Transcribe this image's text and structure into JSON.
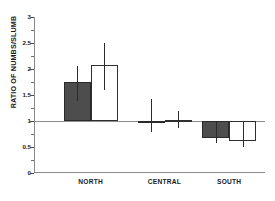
{
  "chart_data": {
    "type": "bar",
    "title": "",
    "subtitle": "",
    "xlabel": "",
    "ylabel": "RATIO OF NUMBS/SLUMB",
    "categories": [
      "NORTH",
      "CENTRAL",
      "SOUTH"
    ],
    "ylim": [
      0,
      3
    ],
    "yticks": [
      0,
      0.5,
      1,
      1.5,
      2,
      2.5,
      3
    ],
    "ytick_labels": [
      "0",
      "0.5",
      "1",
      "1.5",
      "2",
      "2.5",
      "3"
    ],
    "baseline": 1,
    "grid": false,
    "legend": false,
    "legend_position": "none",
    "annotations": [],
    "series": [
      {
        "name": "filled",
        "color": "#4d4d4d",
        "fill": "solid",
        "values": [
          1.75,
          1.0,
          0.67
        ],
        "err_low": [
          1.38,
          0.78,
          0.58
        ],
        "err_high": [
          2.05,
          1.43,
          1.0
        ]
      },
      {
        "name": "open",
        "color": "#ffffff",
        "fill": "open",
        "values": [
          2.08,
          1.02,
          0.61
        ],
        "err_low": [
          1.6,
          0.87,
          0.5
        ],
        "err_high": [
          2.5,
          1.2,
          1.0
        ]
      }
    ]
  },
  "axis": {
    "tick_labels": [
      "3",
      "2.5",
      "2",
      "1.5",
      "1",
      "0.5",
      "0"
    ],
    "category_labels": [
      "NORTH",
      "CENTRAL",
      "SOUTH"
    ],
    "y_axis_title": "RATIO OF NUMBS/SLUMB"
  },
  "colors": {
    "filled_bar": "#4d4d4d",
    "open_bar": "#ffffff",
    "bar_outline": "#2a2a2a",
    "axis": "#8a8a8a",
    "error_bar": "#2b2b2b",
    "text": "#1a1a1a",
    "background": "#ffffff"
  }
}
